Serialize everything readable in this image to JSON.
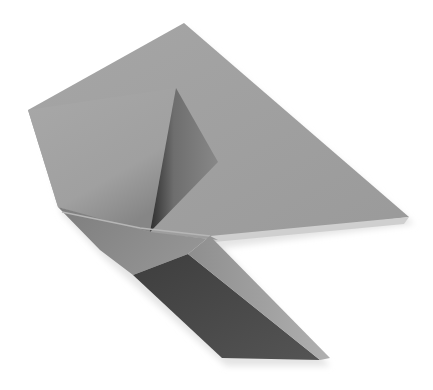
{
  "image": {
    "subject": "origami fold",
    "width": 433,
    "height": 390,
    "background": "#ffffff"
  },
  "palette": {
    "main_face": "#9e9e9e",
    "main_face_light": "#a8a8a8",
    "left_flap": "#a4a4a4",
    "left_flap_shadow": "#8a8a8a",
    "inner_flap": "#7a7a7a",
    "inner_flap_dark": "#2e2e2e",
    "lower_band": "#8c8c8c",
    "lower_band_crease": "#b4b4b4",
    "strip_dark": "#4a4a4a",
    "strip_light_edge": "#a6a6a6",
    "shadow": "#d8d8d8"
  },
  "shapes": {
    "main_face": "28,110 184,23 409,217 218,240 140,232 58,207",
    "left_flap": "28,110 176,88 150,232 58,207",
    "inner_flap": "176,88 218,162 150,232",
    "inner_flap_shadow": "176,88 160,140 146,228 155,225 172,120",
    "lower_band": "58,207 140,232 218,240 210,234 188,254 133,275 100,250",
    "crease_line": "62,212 140,228 210,236",
    "dark_strip": "133,275 188,254 320,360 222,358",
    "light_edge": "188,254 210,234 330,358 320,360",
    "notch_shadow": "210,234 409,217 405,224 215,240"
  }
}
